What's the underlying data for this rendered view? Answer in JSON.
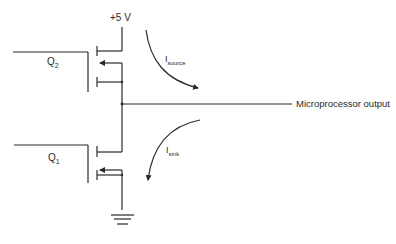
{
  "diagram": {
    "type": "cmos-output-stage",
    "supply_label": "+5 V",
    "output_label": "Microprocessor output",
    "transistors": [
      {
        "id": "Q2",
        "label_main": "Q",
        "label_sub": "2",
        "role": "pull-up"
      },
      {
        "id": "Q1",
        "label_main": "Q",
        "label_sub": "1",
        "role": "pull-down"
      }
    ],
    "currents": [
      {
        "id": "source",
        "label_main": "I",
        "label_sub": "source"
      },
      {
        "id": "sink",
        "label_main": "I",
        "label_sub": "sink"
      }
    ],
    "ground_label": "ground"
  },
  "colors": {
    "line": "#2a2a2a",
    "background": "#ffffff"
  }
}
